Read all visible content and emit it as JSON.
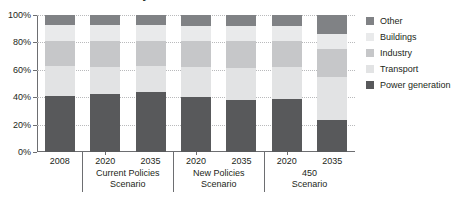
{
  "chart_data": {
    "type": "bar",
    "stacked": true,
    "stack_mode": "percent",
    "title_visible_text": "by sector and scenario",
    "xlabel": "",
    "ylabel": "",
    "ylim": [
      0,
      100
    ],
    "grid": true,
    "legend_position": "right",
    "ytick_labels": [
      "0%",
      "20%",
      "40%",
      "60%",
      "80%",
      "100%"
    ],
    "ytick_values": [
      0,
      20,
      40,
      60,
      80,
      100
    ],
    "categories": [
      "2008",
      "2020",
      "2035",
      "2020",
      "2035",
      "2020",
      "2035"
    ],
    "groups": [
      {
        "label": "",
        "years": [
          "2008"
        ]
      },
      {
        "label": "Current Policies\nScenario",
        "years": [
          "2020",
          "2035"
        ]
      },
      {
        "label": "New Policies\nScenario",
        "years": [
          "2020",
          "2035"
        ]
      },
      {
        "label": "450\nScenario",
        "years": [
          "2020",
          "2035"
        ]
      }
    ],
    "series": [
      {
        "name": "Power generation",
        "color": "#58595b",
        "values": [
          41,
          42,
          44,
          40,
          38,
          39,
          23
        ]
      },
      {
        "name": "Transport",
        "color": "#e2e3e4",
        "values": [
          22,
          20,
          19,
          22,
          23,
          23,
          32
        ]
      },
      {
        "name": "Industry",
        "color": "#c6c7c9",
        "values": [
          18,
          19,
          18,
          19,
          20,
          19,
          20
        ]
      },
      {
        "name": "Buildings",
        "color": "#e9eaeb",
        "values": [
          12,
          12,
          12,
          11,
          11,
          11,
          11
        ]
      },
      {
        "name": "Other",
        "color": "#808285",
        "values": [
          7,
          7,
          7,
          8,
          8,
          8,
          14
        ]
      }
    ],
    "legend_entries": [
      {
        "label": "Other",
        "color": "#808285"
      },
      {
        "label": "Buildings",
        "color": "#e9eaeb"
      },
      {
        "label": "Industry",
        "color": "#c6c7c9"
      },
      {
        "label": "Transport",
        "color": "#e2e3e4"
      },
      {
        "label": "Power generation",
        "color": "#58595b"
      }
    ]
  },
  "axis_color": "#6d6e71",
  "grid_color": "#b9babc",
  "text_color": "#231f20"
}
